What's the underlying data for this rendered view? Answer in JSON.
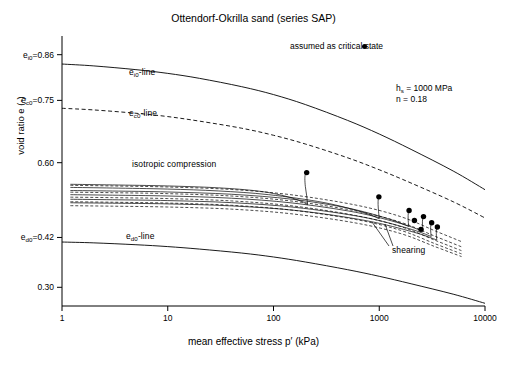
{
  "chart_data": {
    "type": "line",
    "title": "Ottendorf-Okrilla sand (series SAP)",
    "xlabel": "mean effective stress p′   (kPa)",
    "ylabel": "void ratio e   (-)",
    "xscale": "log",
    "xlim": [
      1,
      10000
    ],
    "ylim": [
      0.255,
      0.905
    ],
    "grid": false,
    "legend_position": "top-right",
    "xticks": [
      {
        "value": 1,
        "label": "1"
      },
      {
        "value": 10,
        "label": "10"
      },
      {
        "value": 100,
        "label": "100"
      },
      {
        "value": 1000,
        "label": "1000"
      },
      {
        "value": 10000,
        "label": "10000"
      }
    ],
    "yticks": [
      {
        "value": 0.86,
        "label": "0.86",
        "prefix": "e",
        "subscript": "i0",
        "equals": "="
      },
      {
        "value": 0.75,
        "label": "0.75",
        "prefix": "e",
        "subscript": "c0",
        "equals": "="
      },
      {
        "value": 0.6,
        "label": "0.60",
        "prefix": "",
        "subscript": "",
        "equals": ""
      },
      {
        "value": 0.42,
        "label": "0.42",
        "prefix": "e",
        "subscript": "d0",
        "equals": "="
      },
      {
        "value": 0.3,
        "label": "0.30",
        "prefix": "",
        "subscript": "",
        "equals": ""
      }
    ],
    "legend": [
      {
        "label": "assumed as critical state",
        "marker": "filled-circle",
        "color": "#000000"
      }
    ],
    "annotations": [
      {
        "id": "ei0-line",
        "text": "e",
        "sub": "i0",
        "suffix": "-line",
        "x": 5.6,
        "y": 0.805
      },
      {
        "id": "ec0-line",
        "text": "e",
        "sub": "c0",
        "suffix": "-line",
        "x": 5.6,
        "y": 0.703
      },
      {
        "id": "ed0-line",
        "text": "e",
        "sub": "d0",
        "suffix": "-line",
        "x": 5.2,
        "y": 0.398
      },
      {
        "id": "isotropic-compression",
        "text": "isotropic compression",
        "x": 6.5,
        "y": 0.578
      },
      {
        "id": "shearing",
        "text": "shearing",
        "x": 2600,
        "y": 0.363
      }
    ],
    "parameters": [
      {
        "name": "h",
        "subscript": "s",
        "equals": "=",
        "value": "1000 MPa"
      },
      {
        "name": "n",
        "subscript": "",
        "equals": "=",
        "value": "0.18"
      }
    ],
    "bounding_curves": [
      {
        "name": "e_i0-line",
        "style": "solid",
        "e0": 0.86,
        "points": [
          [
            1,
            0.8375
          ],
          [
            2,
            0.833
          ],
          [
            5,
            0.824
          ],
          [
            10,
            0.815
          ],
          [
            20,
            0.803
          ],
          [
            50,
            0.783
          ],
          [
            100,
            0.764
          ],
          [
            200,
            0.74
          ],
          [
            500,
            0.702
          ],
          [
            1000,
            0.669
          ],
          [
            2000,
            0.632
          ],
          [
            5000,
            0.58
          ],
          [
            10000,
            0.535
          ]
        ]
      },
      {
        "name": "e_c0-line",
        "style": "dashed",
        "e0": 0.75,
        "points": [
          [
            1,
            0.731
          ],
          [
            2,
            0.727
          ],
          [
            5,
            0.719
          ],
          [
            10,
            0.711
          ],
          [
            20,
            0.7
          ],
          [
            50,
            0.683
          ],
          [
            100,
            0.666
          ],
          [
            200,
            0.645
          ],
          [
            500,
            0.612
          ],
          [
            1000,
            0.583
          ],
          [
            2000,
            0.551
          ],
          [
            5000,
            0.506
          ],
          [
            10000,
            0.467
          ]
        ]
      },
      {
        "name": "e_d0-line",
        "style": "solid",
        "e0": 0.42,
        "points": [
          [
            1,
            0.409
          ],
          [
            2,
            0.407
          ],
          [
            5,
            0.4025
          ],
          [
            10,
            0.398
          ],
          [
            20,
            0.392
          ],
          [
            50,
            0.3825
          ],
          [
            100,
            0.373
          ],
          [
            200,
            0.361
          ],
          [
            500,
            0.3425
          ],
          [
            1000,
            0.3265
          ],
          [
            2000,
            0.3085
          ],
          [
            5000,
            0.2835
          ],
          [
            10000,
            0.2615
          ]
        ]
      }
    ],
    "series": [
      {
        "name": "test-1",
        "style": "solid",
        "isotropic_compression": [
          [
            1.2,
            0.548
          ],
          [
            3,
            0.5465
          ],
          [
            10,
            0.544
          ],
          [
            30,
            0.5395
          ],
          [
            70,
            0.532
          ],
          [
            120,
            0.5215
          ],
          [
            180,
            0.508
          ],
          [
            210,
            0.499
          ]
        ],
        "shearing": [
          [
            210,
            0.499
          ],
          [
            206,
            0.52
          ],
          [
            200,
            0.543
          ],
          [
            198,
            0.5615
          ],
          [
            200,
            0.572
          ],
          [
            206,
            0.576
          ]
        ],
        "critical_state": [
          206,
          0.5762
        ]
      },
      {
        "name": "test-2",
        "style": "solid",
        "isotropic_compression": [
          [
            1.2,
            0.5405
          ],
          [
            3,
            0.539
          ],
          [
            10,
            0.5365
          ],
          [
            30,
            0.532
          ],
          [
            90,
            0.523
          ],
          [
            300,
            0.504
          ],
          [
            700,
            0.4805
          ],
          [
            1000,
            0.465
          ]
        ],
        "shearing": [
          [
            1000,
            0.465
          ],
          [
            985,
            0.482
          ],
          [
            975,
            0.499
          ],
          [
            978,
            0.5115
          ],
          [
            992,
            0.5175
          ]
        ],
        "critical_state": [
          992,
          0.5178
        ]
      },
      {
        "name": "test-3",
        "style": "solid",
        "isotropic_compression": [
          [
            1.2,
            0.533
          ],
          [
            3,
            0.5318
          ],
          [
            10,
            0.5295
          ],
          [
            40,
            0.524
          ],
          [
            150,
            0.512
          ],
          [
            500,
            0.491
          ],
          [
            1200,
            0.4655
          ],
          [
            1900,
            0.4465
          ]
        ],
        "shearing": [
          [
            1900,
            0.4465
          ],
          [
            1880,
            0.46
          ],
          [
            1875,
            0.4725
          ],
          [
            1890,
            0.481
          ],
          [
            1915,
            0.4848
          ]
        ],
        "critical_state": [
          1915,
          0.485
        ]
      },
      {
        "name": "test-4",
        "style": "solid",
        "isotropic_compression": [
          [
            1.2,
            0.523
          ],
          [
            3,
            0.5218
          ],
          [
            10,
            0.5198
          ],
          [
            40,
            0.5145
          ],
          [
            150,
            0.503
          ],
          [
            600,
            0.4805
          ],
          [
            1600,
            0.4535
          ],
          [
            2600,
            0.4345
          ]
        ],
        "shearing": [
          [
            2600,
            0.4345
          ],
          [
            2570,
            0.446
          ],
          [
            2560,
            0.4575
          ],
          [
            2580,
            0.466
          ],
          [
            2620,
            0.47
          ]
        ],
        "critical_state": [
          2620,
          0.4702
        ]
      },
      {
        "name": "test-5",
        "style": "solid",
        "isotropic_compression": [
          [
            1.2,
            0.512
          ],
          [
            3,
            0.5108
          ],
          [
            10,
            0.5088
          ],
          [
            40,
            0.5038
          ],
          [
            160,
            0.4925
          ],
          [
            700,
            0.469
          ],
          [
            1900,
            0.4415
          ],
          [
            3100,
            0.4225
          ]
        ],
        "shearing": [
          [
            3100,
            0.4225
          ],
          [
            3070,
            0.433
          ],
          [
            3060,
            0.4435
          ],
          [
            3085,
            0.4515
          ],
          [
            3130,
            0.4552
          ]
        ],
        "critical_state": [
          3130,
          0.4554
        ]
      },
      {
        "name": "test-6",
        "style": "solid",
        "isotropic_compression": [
          [
            1.2,
            0.5035
          ],
          [
            3,
            0.5025
          ],
          [
            10,
            0.5008
          ],
          [
            40,
            0.496
          ],
          [
            170,
            0.4845
          ],
          [
            750,
            0.4605
          ],
          [
            2100,
            0.433
          ],
          [
            3500,
            0.414
          ]
        ],
        "shearing": [
          [
            3500,
            0.414
          ],
          [
            3470,
            0.424
          ],
          [
            3465,
            0.434
          ],
          [
            3495,
            0.4415
          ],
          [
            3545,
            0.445
          ]
        ],
        "critical_state": [
          3545,
          0.4452
        ]
      },
      {
        "name": "test-7-dashed",
        "style": "dashed",
        "isotropic_compression": [
          [
            1.2,
            0.5455
          ],
          [
            3,
            0.544
          ],
          [
            10,
            0.5415
          ],
          [
            40,
            0.5355
          ],
          [
            150,
            0.5225
          ],
          [
            600,
            0.498
          ],
          [
            1600,
            0.47
          ],
          [
            3400,
            0.4355
          ],
          [
            6000,
            0.41
          ]
        ],
        "shearing": [],
        "critical_state": null
      },
      {
        "name": "test-8-dashed",
        "style": "dashed",
        "isotropic_compression": [
          [
            1.2,
            0.529
          ],
          [
            3,
            0.5278
          ],
          [
            10,
            0.5255
          ],
          [
            40,
            0.5198
          ],
          [
            150,
            0.5075
          ],
          [
            600,
            0.4838
          ],
          [
            1600,
            0.4565
          ],
          [
            3400,
            0.4225
          ],
          [
            6000,
            0.3975
          ]
        ],
        "shearing": [],
        "critical_state": null
      },
      {
        "name": "test-9-dashed",
        "style": "dashed",
        "isotropic_compression": [
          [
            1.2,
            0.517
          ],
          [
            3,
            0.5158
          ],
          [
            10,
            0.5136
          ],
          [
            40,
            0.508
          ],
          [
            150,
            0.496
          ],
          [
            600,
            0.4728
          ],
          [
            1600,
            0.446
          ],
          [
            3400,
            0.4128
          ],
          [
            6000,
            0.3882
          ]
        ],
        "shearing": [],
        "critical_state": null
      },
      {
        "name": "test-10-dashed",
        "style": "dashed",
        "isotropic_compression": [
          [
            1.2,
            0.506
          ],
          [
            3,
            0.5048
          ],
          [
            10,
            0.5028
          ],
          [
            40,
            0.4975
          ],
          [
            150,
            0.4858
          ],
          [
            600,
            0.4632
          ],
          [
            1600,
            0.437
          ],
          [
            3400,
            0.4045
          ],
          [
            6000,
            0.3805
          ]
        ],
        "shearing": [],
        "critical_state": null
      },
      {
        "name": "test-11-dashed",
        "style": "dashed",
        "isotropic_compression": [
          [
            1.2,
            0.4965
          ],
          [
            3,
            0.4953
          ],
          [
            10,
            0.4933
          ],
          [
            40,
            0.4882
          ],
          [
            150,
            0.4768
          ],
          [
            600,
            0.4548
          ],
          [
            1600,
            0.4292
          ],
          [
            3400,
            0.3975
          ],
          [
            6000,
            0.374
          ]
        ],
        "shearing": [],
        "critical_state": null
      }
    ],
    "critical_state_points": [
      [
        206,
        0.5762
      ],
      [
        992,
        0.5178
      ],
      [
        1915,
        0.485
      ],
      [
        2620,
        0.4702
      ],
      [
        3130,
        0.4554
      ],
      [
        3545,
        0.4452
      ],
      [
        2150,
        0.461
      ],
      [
        2480,
        0.4395
      ]
    ]
  }
}
